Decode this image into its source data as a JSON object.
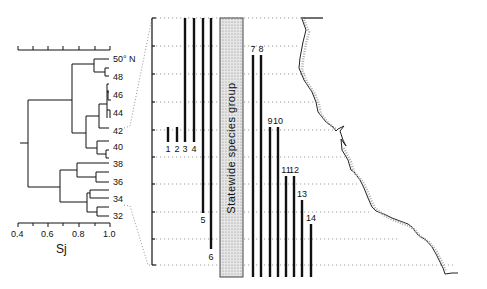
{
  "dendrogram": {
    "axis_label": "Sj",
    "axis_ticks": [
      "0.4",
      "0.6",
      "0.8",
      "1.0"
    ],
    "leaf_labels": [
      "50° N",
      "48",
      "46",
      "44",
      "42",
      "40",
      "38",
      "36",
      "34",
      "32"
    ]
  },
  "zone_panel": {
    "statewide_label": "Statewide species group",
    "bar_labels": [
      "1",
      "2",
      "3",
      "4",
      "5",
      "6",
      "7",
      "8",
      "9",
      "10",
      "11",
      "12",
      "13",
      "14"
    ]
  },
  "colors": {
    "ink": "#111111",
    "stipple": "#d4d4d4",
    "background": "#ffffff"
  }
}
